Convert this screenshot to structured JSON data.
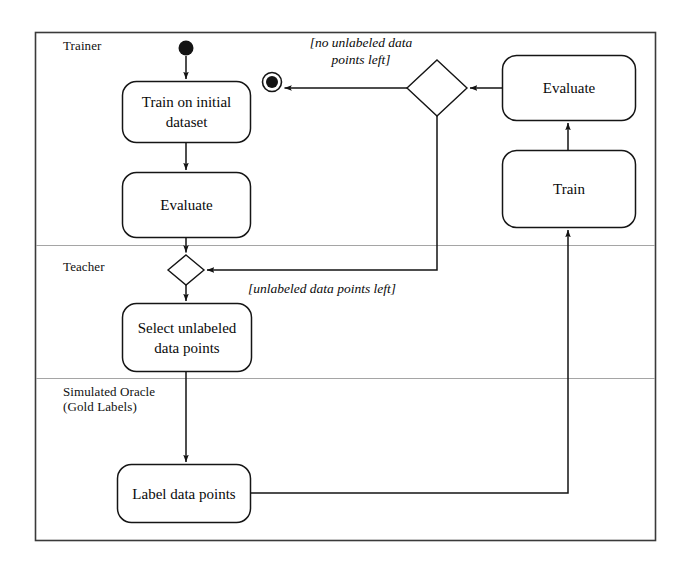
{
  "diagram": {
    "type": "uml-activity-diagram",
    "border_color": "#3a3a3a",
    "line_color": "#1a1a1a",
    "lane_divider_color": "#9a9a9a",
    "background": "#ffffff",
    "swimlanes": [
      {
        "id": "trainer",
        "label": "Trainer"
      },
      {
        "id": "teacher",
        "label": "Teacher"
      },
      {
        "id": "oracle",
        "label": "Simulated Oracle\n(Gold Labels)"
      }
    ],
    "nodes": [
      {
        "id": "start",
        "kind": "initial-node",
        "lane": "trainer"
      },
      {
        "id": "end",
        "kind": "final-node",
        "lane": "trainer"
      },
      {
        "id": "train-initial",
        "kind": "action",
        "lane": "trainer",
        "label": "Train on initial\ndataset"
      },
      {
        "id": "evaluate-left",
        "kind": "action",
        "lane": "trainer",
        "label": "Evaluate"
      },
      {
        "id": "evaluate-right",
        "kind": "action",
        "lane": "trainer",
        "label": "Evaluate"
      },
      {
        "id": "train-right",
        "kind": "action",
        "lane": "trainer",
        "label": "Train"
      },
      {
        "id": "decision-top",
        "kind": "decision",
        "lane": "trainer",
        "label": ""
      },
      {
        "id": "merge-teacher",
        "kind": "merge",
        "lane": "teacher",
        "label": ""
      },
      {
        "id": "select-unlabeled",
        "kind": "action",
        "lane": "teacher",
        "label": "Select unlabeled\ndata points"
      },
      {
        "id": "label-data",
        "kind": "action",
        "lane": "oracle",
        "label": "Label data points"
      }
    ],
    "edges": [
      {
        "from": "start",
        "to": "train-initial",
        "guard": ""
      },
      {
        "from": "train-initial",
        "to": "evaluate-left",
        "guard": ""
      },
      {
        "from": "evaluate-left",
        "to": "merge-teacher",
        "guard": ""
      },
      {
        "from": "merge-teacher",
        "to": "select-unlabeled",
        "guard": ""
      },
      {
        "from": "select-unlabeled",
        "to": "label-data",
        "guard": ""
      },
      {
        "from": "label-data",
        "to": "train-right",
        "guard": ""
      },
      {
        "from": "train-right",
        "to": "evaluate-right",
        "guard": ""
      },
      {
        "from": "evaluate-right",
        "to": "decision-top",
        "guard": ""
      },
      {
        "from": "decision-top",
        "to": "end",
        "guard": "[no unlabeled data\npoints left]"
      },
      {
        "from": "decision-top",
        "to": "merge-teacher",
        "guard": "[unlabeled data points left]"
      }
    ],
    "guards": {
      "no_unlabeled": "[no unlabeled data\npoints left]",
      "unlabeled_left": "[unlabeled data points left]"
    }
  }
}
